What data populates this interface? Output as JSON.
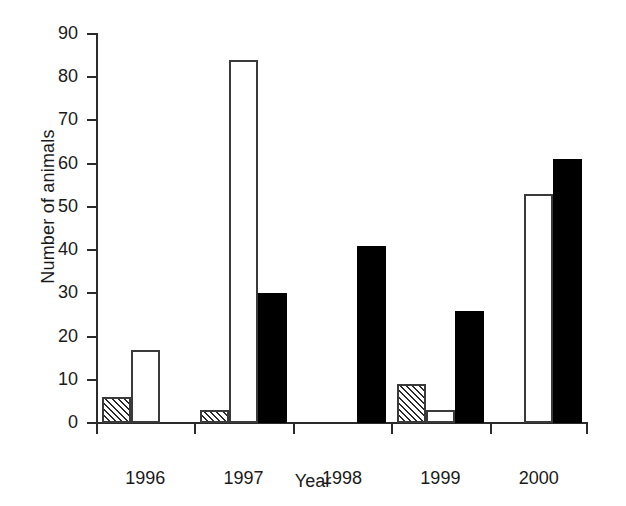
{
  "chart_data": {
    "type": "bar",
    "title": "",
    "xlabel": "Year",
    "ylabel": "Number of animals",
    "categories": [
      "1996",
      "1997",
      "1998",
      "1999",
      "2000"
    ],
    "series": [
      {
        "name": "hatched",
        "pattern": "diagonal-hatch",
        "values": [
          6,
          3,
          0,
          9,
          0
        ]
      },
      {
        "name": "white",
        "pattern": "open",
        "values": [
          17,
          84,
          0,
          3,
          53
        ]
      },
      {
        "name": "black",
        "pattern": "filled",
        "values": [
          0,
          30,
          41,
          26,
          61
        ]
      }
    ],
    "ylim": [
      0,
      90
    ],
    "ytick_labels": [
      "0",
      "10",
      "20",
      "30",
      "40",
      "50",
      "60",
      "70",
      "80",
      "90"
    ],
    "ytick_values": [
      0,
      10,
      20,
      30,
      40,
      50,
      60,
      70,
      80,
      90
    ],
    "grid": false,
    "legend": "none",
    "colors": {
      "axis": "#2b2b2b",
      "text": "#1a1a1a",
      "filled_bar": "#000000",
      "open_bar": "#ffffff",
      "bar_outline": "#3a3a3a",
      "background": "#ffffff"
    }
  }
}
